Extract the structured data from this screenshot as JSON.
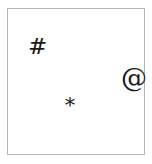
{
  "panel": {
    "name": "symbol-canvas",
    "background_color": "#ffffff",
    "border_color": "#b5b5b5",
    "border_width_px": 1,
    "x": 7,
    "y": 8,
    "width": 138,
    "height": 147
  },
  "glyphs": [
    {
      "id": "hash",
      "character": "#",
      "semantic_name": "hash-symbol",
      "color": "#1a1a1a",
      "font_size_px": 23,
      "x": 20,
      "y": 26
    },
    {
      "id": "at",
      "character": "@",
      "semantic_name": "at-symbol",
      "color": "#1a1a1a",
      "font_size_px": 26,
      "x": 113,
      "y": 56
    },
    {
      "id": "asterisk",
      "character": "*",
      "semantic_name": "asterisk-symbol",
      "color": "#1a1a1a",
      "font_size_px": 20,
      "x": 57,
      "y": 86
    }
  ]
}
